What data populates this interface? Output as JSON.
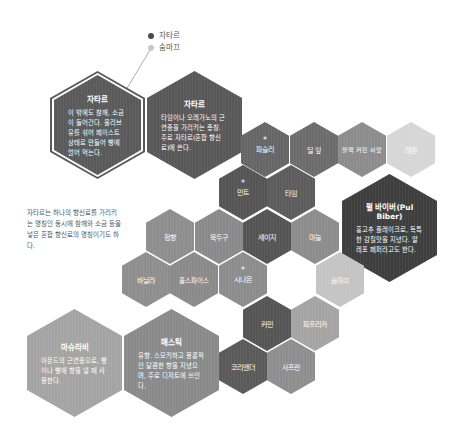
{
  "legend": {
    "items": [
      {
        "label": "자타르",
        "color": "#4a4a4a"
      },
      {
        "label": "숨마끄",
        "color": "#c8c8c8"
      }
    ]
  },
  "note": "자타르는 하나의 향신료를 가리키는 명칭인 동시에 참깨와 소금 등을 넣은 혼합 향신료의 명칭이기도 하다.",
  "large_hexes": [
    {
      "id": "zaatar-blend",
      "title": "자타르",
      "desc": "이 밖에도 참깨, 소금이 들어간다. 올리브유를 섞어 페이스트 상태로 만들어 빵에 얹어 먹는다.",
      "color": "#5a5a5a",
      "outlined": true
    },
    {
      "id": "zaatar-herb",
      "title": "자타르",
      "desc": "타임이나 오레가노의 근연종을 가리키는 총칭. 주로 자타르(혼합 향신료)에 쓴다.",
      "color": "#585858",
      "outlined": false
    },
    {
      "id": "pul-biber",
      "title": "펄 바이버(Pul Biber)",
      "desc": "홍고추 플레이크로, 독특한 감칠맛을 지녔다. 알레포 페퍼라고도 한다.",
      "color": "#3e3e3e",
      "outlined": false
    },
    {
      "id": "mahlab",
      "title": "마슈라비",
      "desc": "아몬드의 근연종으로, 빵이나 빵에 향을 낼 때 사용한다.",
      "color": "#a4a4a4",
      "outlined": false
    },
    {
      "id": "mastic",
      "title": "매스틱",
      "desc": "유향. 스모키하고 몽롱적인 달콤한 향을 지녔으며, 주로 디저트에 쓰인다.",
      "color": "#8a8a8a",
      "outlined": false
    }
  ],
  "small_hexes": [
    {
      "label": "파슬리",
      "star": true,
      "color": "#666666"
    },
    {
      "label": "딜 잎",
      "star": false,
      "color": "#6c6c6c"
    },
    {
      "label": "블랙 커민 씨앗",
      "star": false,
      "color": "#8c8c8c"
    },
    {
      "label": "레몬",
      "star": false,
      "color": "#d6d6d6"
    },
    {
      "label": "민트",
      "star": true,
      "color": "#555555"
    },
    {
      "label": "타임",
      "star": false,
      "color": "#5c5c5c"
    },
    {
      "label": "정향",
      "star": false,
      "color": "#8e8e8e"
    },
    {
      "label": "육두구",
      "star": false,
      "color": "#8a8a8a"
    },
    {
      "label": "세이지",
      "star": false,
      "color": "#545454"
    },
    {
      "label": "마늘",
      "star": false,
      "color": "#8c8c8c"
    },
    {
      "label": "바닐라",
      "star": false,
      "color": "#8e8e8e"
    },
    {
      "label": "올스파이스",
      "star": false,
      "color": "#8a8a8a"
    },
    {
      "label": "시나몬",
      "star": true,
      "color": "#8c8c8c"
    },
    {
      "label": "숨마끄",
      "star": false,
      "color": "#c4c4c4"
    },
    {
      "label": "커민",
      "star": false,
      "color": "#555555"
    },
    {
      "label": "파프리카",
      "star": false,
      "color": "#a4a4a4"
    },
    {
      "label": "코리앤더",
      "star": false,
      "color": "#5a5a5a"
    },
    {
      "label": "사프란",
      "star": false,
      "color": "#8e8e8e"
    }
  ],
  "star_symbol": "*"
}
